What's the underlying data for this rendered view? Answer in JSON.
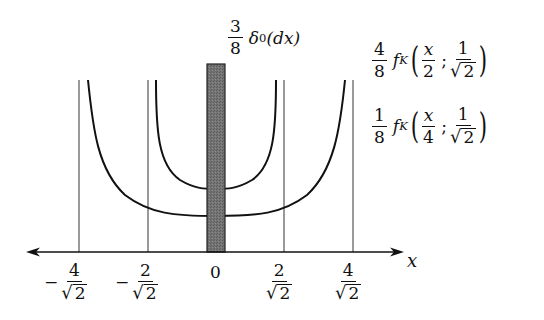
{
  "title_label": {
    "coef_num": "3",
    "coef_den": "8",
    "symbol": "δ",
    "sub": "0",
    "arg": "(dx)"
  },
  "legend": [
    {
      "coef_num": "4",
      "coef_den": "8",
      "func": "f",
      "sub": "K",
      "arg_num": "x",
      "arg_den": "2",
      "sep": ";",
      "param_num": "1",
      "param_den": "2"
    },
    {
      "coef_num": "1",
      "coef_den": "8",
      "func": "f",
      "sub": "K",
      "arg_num": "x",
      "arg_den": "4",
      "sep": ";",
      "param_num": "1",
      "param_den": "2"
    }
  ],
  "axis": {
    "label": "x",
    "ticks": [
      {
        "sign": "−",
        "num": "4",
        "den": "2",
        "radical": "√"
      },
      {
        "sign": "−",
        "num": "2",
        "den": "2",
        "radical": "√"
      },
      {
        "sign": "",
        "text": "0"
      },
      {
        "sign": "",
        "num": "2",
        "den": "2",
        "radical": "√"
      },
      {
        "sign": "",
        "num": "4",
        "den": "2",
        "radical": "√"
      }
    ]
  },
  "colors": {
    "line": "#111111",
    "guide": "#555555",
    "bar_fill": "#6e6e6e",
    "bar_stroke": "#222222"
  }
}
